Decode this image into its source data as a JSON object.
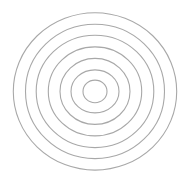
{
  "diagram": {
    "type": "concentric-circles",
    "background": "#ffffff",
    "stroke_color": "#a8a8a8",
    "stroke_width": 1.1,
    "center": {
      "x": 95,
      "y": 91.4
    },
    "rings": [
      {
        "rx": 81.7,
        "ry": 78.7
      },
      {
        "rx": 69.5,
        "ry": 67.2
      },
      {
        "rx": 58.8,
        "ry": 56.2
      },
      {
        "rx": 46.7,
        "ry": 44.5
      },
      {
        "rx": 35.0,
        "ry": 33.0
      },
      {
        "rx": 24.0,
        "ry": 21.5
      },
      {
        "rx": 12.0,
        "ry": 11.3
      }
    ]
  }
}
